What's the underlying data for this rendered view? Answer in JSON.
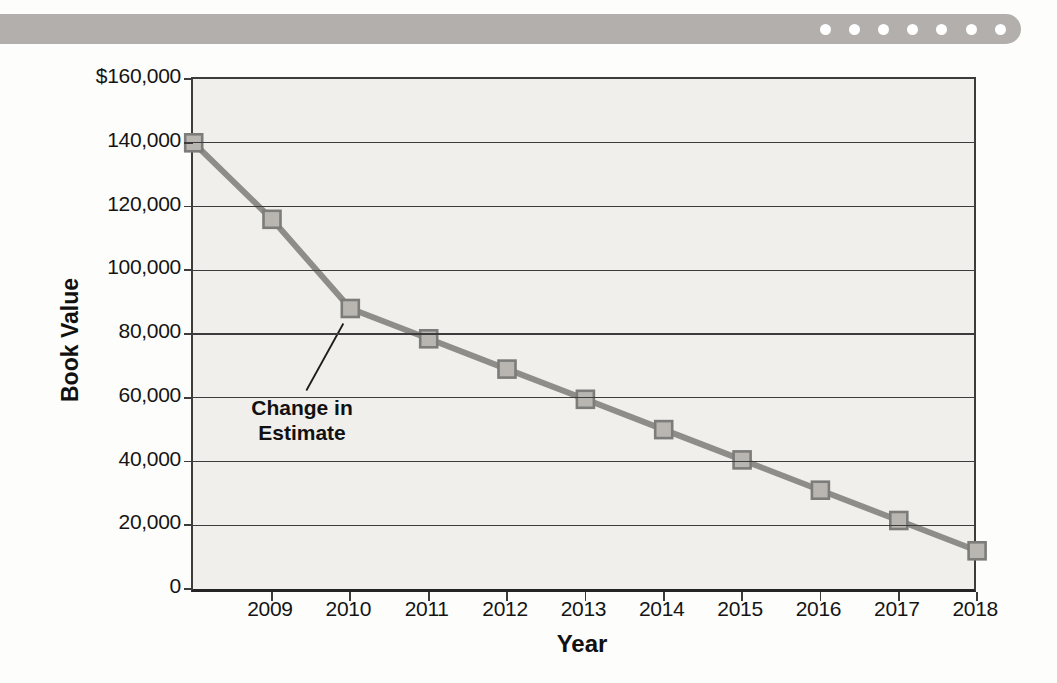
{
  "banner": {
    "color": "#b2afac",
    "dot_color": "#ffffff",
    "dot_count": 7
  },
  "chart_data": {
    "type": "line",
    "title": "",
    "xlabel": "Year",
    "ylabel": "Book Value",
    "x": [
      2008,
      2009,
      2010,
      2011,
      2012,
      2013,
      2014,
      2015,
      2016,
      2017,
      2018
    ],
    "x_tick_labels": [
      "2009",
      "2010",
      "2011",
      "2012",
      "2013",
      "2014",
      "2015",
      "2016",
      "2017",
      "2018"
    ],
    "series": [
      {
        "name": "book-value",
        "values": [
          140000,
          116000,
          88000,
          78500,
          69000,
          59500,
          50000,
          40500,
          31000,
          21500,
          12000
        ]
      }
    ],
    "ylim": [
      0,
      160000
    ],
    "y_tick_step": 20000,
    "y_tick_labels": [
      "$160,000",
      "140,000",
      "120,000",
      "100,000",
      "80,000",
      "60,000",
      "40,000",
      "20,000",
      "0"
    ],
    "grid": "horizontal",
    "legend": "none",
    "annotation": {
      "label": [
        "Change in",
        "Estimate"
      ],
      "target_x": 2010,
      "target_value": 88000
    },
    "colors": {
      "plot_bg": "#f0efec",
      "grid": "#3c3c3c",
      "line": "#8f8d8a",
      "marker_fill": "#b9b6b1",
      "marker_border": "#7c7c7a",
      "text": "#141414",
      "pointer": "#1c1c1c"
    }
  }
}
